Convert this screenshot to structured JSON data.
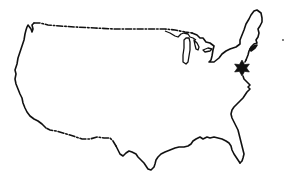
{
  "map": {
    "subject": "Outline map of the contiguous United States",
    "style": "black line drawing on white background",
    "colors": {
      "background": "#ffffff",
      "outline": "#111111",
      "marker": "#111111"
    },
    "borders": {
      "northern_border": "dash-dot line (US-Canada border)",
      "southern_border": "dash-dot line (US-Mexico border)",
      "coastlines": "solid line"
    },
    "features": [
      {
        "name": "Great Lakes",
        "type": "lake-outline"
      }
    ],
    "markers": [
      {
        "name": "location-marker",
        "shape": "six-pointed star",
        "region": "Mid-Atlantic East Coast (near Philadelphia / New Jersey area)",
        "position_px": [
          242,
          68
        ]
      }
    ]
  }
}
